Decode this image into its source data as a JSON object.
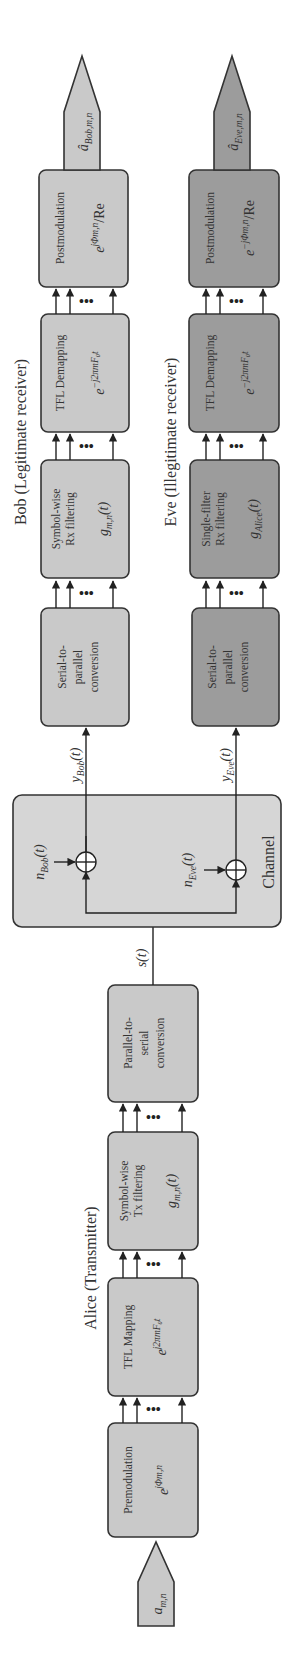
{
  "diagram": {
    "orientation": "rotated-90-ccw (signal flows bottom to top)",
    "colors": {
      "light_block": "#c9c9c9",
      "dark_block": "#9c9c9c",
      "channel_block": "#d6d6d6",
      "stroke": "#333333"
    },
    "alice": {
      "title": "Alice (Transmitter)",
      "input": {
        "symbol": "a",
        "subscript": "m,n"
      },
      "blocks": [
        {
          "id": "premodulation",
          "line1": "Premodulation",
          "line2": "",
          "math": "e",
          "math_sup": "jΦm,n"
        },
        {
          "id": "tfl-mapping",
          "line1": "TFL Mapping",
          "line2": "",
          "math": "e",
          "math_sup": "j2πmF₀t"
        },
        {
          "id": "tx-filtering",
          "line1": "Symbol-wise",
          "line2": "Tx filtering",
          "math": "g",
          "math_sub": "m,n",
          "math_tail": "(t)"
        },
        {
          "id": "parallel-to-serial",
          "line1": "Parallel-to-",
          "line2": "serial",
          "line3": "conversion"
        }
      ],
      "output_label": "s(t)"
    },
    "channel": {
      "title": "Channel",
      "noise_bob": {
        "symbol": "n",
        "subscript": "Bob",
        "tail": "(t)"
      },
      "noise_eve": {
        "symbol": "n",
        "subscript": "Eve",
        "tail": "(t)"
      },
      "adder_symbol": "+"
    },
    "bob": {
      "title": "Bob (Legitimate receiver)",
      "input_label": {
        "symbol": "y",
        "subscript": "Bob",
        "tail": "(t)"
      },
      "blocks": [
        {
          "id": "serial-to-parallel",
          "line1": "Serial-to-",
          "line2": "parallel",
          "line3": "conversion"
        },
        {
          "id": "rx-filtering",
          "line1": "Symbol-wise",
          "line2": "Rx filtering",
          "math": "g",
          "math_sub": "m,n",
          "math_tail": "(t)"
        },
        {
          "id": "tfl-demapping",
          "line1": "TFL Demapping",
          "math": "e",
          "math_sup": "−j2πmF₀t"
        },
        {
          "id": "postmodulation",
          "line1": "Postmodulation",
          "math": "e",
          "math_sup": "jΦm,n",
          "math_tail": "/Re"
        }
      ],
      "output": {
        "symbol": "â",
        "subscript": "Bob,m,n"
      }
    },
    "eve": {
      "title": "Eve (Illegitimate receiver)",
      "input_label": {
        "symbol": "y",
        "subscript": "Eve",
        "tail": "(t)"
      },
      "blocks": [
        {
          "id": "serial-to-parallel",
          "line1": "Serial-to-",
          "line2": "parallel",
          "line3": "conversion"
        },
        {
          "id": "rx-filtering",
          "line1": "Single-filter",
          "line2": "Rx filtering",
          "math": "g",
          "math_sub": "Alice",
          "math_tail": "(t)"
        },
        {
          "id": "tfl-demapping",
          "line1": "TFL Demapping",
          "math": "e",
          "math_sup": "−j2πmF₀t"
        },
        {
          "id": "postmodulation",
          "line1": "Postmodulation",
          "math": "e",
          "math_sup": "−jΦm,n",
          "math_tail": "/Re"
        }
      ],
      "output": {
        "symbol": "â",
        "subscript": "Eve,m,n"
      }
    },
    "ellipsis": "•••"
  }
}
